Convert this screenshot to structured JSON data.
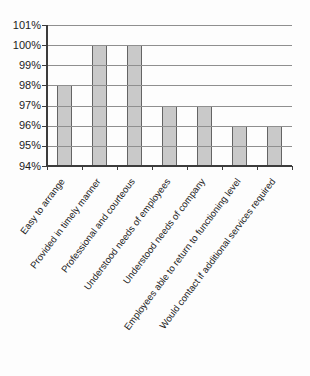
{
  "chart_data": {
    "type": "bar",
    "title": "",
    "xlabel": "",
    "ylabel": "",
    "categories": [
      "Easy to arrange",
      "Provided in timely manner",
      "Professional and courteous",
      "Understood needs of employees",
      "Understood needs of company",
      "Employees able to return to functioning level",
      "Would contact if additional services required"
    ],
    "values": [
      98,
      100,
      100,
      97,
      97,
      96,
      96
    ],
    "value_suffix": "%",
    "ylim": [
      94,
      101
    ],
    "ytick_step": 1,
    "ytick_labels": [
      "101%",
      "100%",
      "99%",
      "98%",
      "97%",
      "96%",
      "95%",
      "94%"
    ],
    "grid": true,
    "gridlines_over_bars": true,
    "legend_position": "none",
    "colors": {
      "bar_fill": "#c9c9c9",
      "bar_border": "#646464",
      "gridline": "#8f8f8f",
      "axis": "#3c3c3c",
      "text": "#1c1c1c",
      "background": "#fdfdfd"
    }
  }
}
